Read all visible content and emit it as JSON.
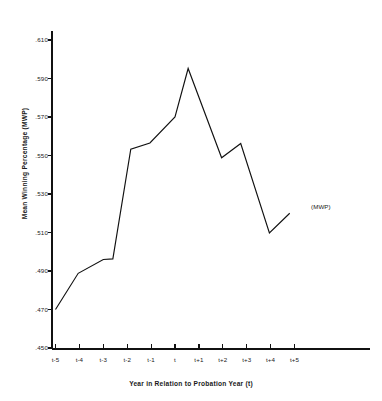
{
  "chart_data": {
    "type": "line",
    "title": "",
    "xlabel": "Year in Relation to Probation Year (t)",
    "ylabel": "Mean Winning Percentage (MWP)",
    "categories": [
      "t-5",
      "t-4",
      "t-3",
      "t-2",
      "t-1",
      "t",
      "t+1",
      "t+2",
      "t+3",
      "t+4",
      "t+5"
    ],
    "xtick_labels": [
      "t-5",
      "t-4",
      "t-3",
      "t-2",
      "t-1",
      "t",
      "t+1",
      "t+2",
      "t+3",
      "t+4",
      "t+5"
    ],
    "ytick_labels": [
      ".610",
      ".590",
      ".570",
      ".550",
      ".530",
      ".510",
      ".490",
      ".470",
      ".450"
    ],
    "ytick_values": [
      0.61,
      0.59,
      0.57,
      0.55,
      0.53,
      0.51,
      0.49,
      0.47,
      0.45
    ],
    "ylim": [
      0.45,
      0.61
    ],
    "xlim": [
      -5.2,
      5.6
    ],
    "grid": false,
    "legend_position": "inline-annotation",
    "series": [
      {
        "name": "(MWP)",
        "label": "(MWP)",
        "color": "#111111",
        "points": [
          {
            "x": -5.0,
            "y": 0.47
          },
          {
            "x": -4.05,
            "y": 0.4888
          },
          {
            "x": -3.0,
            "y": 0.496
          },
          {
            "x": -2.6,
            "y": 0.4963
          },
          {
            "x": -1.85,
            "y": 0.5533
          },
          {
            "x": -1.05,
            "y": 0.5565
          },
          {
            "x": 0.0,
            "y": 0.57
          },
          {
            "x": 0.55,
            "y": 0.5952
          },
          {
            "x": 1.95,
            "y": 0.5488
          },
          {
            "x": 2.75,
            "y": 0.5562
          },
          {
            "x": 3.95,
            "y": 0.5098
          },
          {
            "x": 4.8,
            "y": 0.52
          }
        ]
      }
    ],
    "annotations": [
      {
        "text": "(MWP)",
        "x": 4.95,
        "y": 0.5225,
        "name": "series-label"
      }
    ]
  },
  "axes": {
    "y_axis_title": "Mean Winning Percentage (MWP)",
    "x_axis_title": "Year in Relation to Probation Year (t)"
  }
}
